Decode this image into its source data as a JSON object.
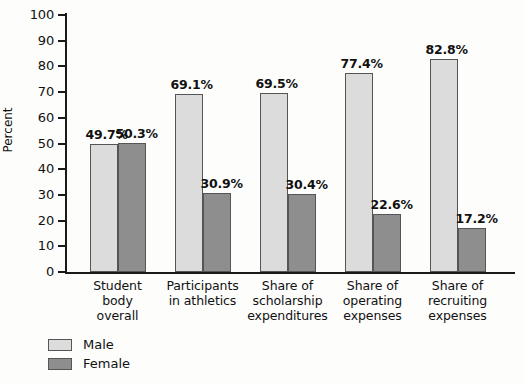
{
  "chart_data": {
    "type": "bar",
    "title": "",
    "xlabel": "",
    "ylabel": "Percent",
    "ylim": [
      0,
      100
    ],
    "ytick_step": 10,
    "yticks": [
      100,
      90,
      80,
      70,
      60,
      50,
      40,
      30,
      20,
      10,
      0
    ],
    "grid": false,
    "legend_position": "bottom-left",
    "value_suffix": "%",
    "categories": [
      "Student body overall",
      "Participants in athletics",
      "Share of scholarship expenditures",
      "Share of operating expenses",
      "Share of recruiting expenses"
    ],
    "category_lines": [
      [
        "Student",
        "body",
        "overall"
      ],
      [
        "Participants",
        "in athletics"
      ],
      [
        "Share of",
        "scholarship",
        "expenditures"
      ],
      [
        "Share of",
        "operating",
        "expenses"
      ],
      [
        "Share of",
        "recruiting",
        "expenses"
      ]
    ],
    "series": [
      {
        "name": "Male",
        "color": "#dcdcdc",
        "values": [
          49.7,
          69.1,
          69.5,
          77.4,
          82.8
        ],
        "labels": [
          "49.7%",
          "69.1%",
          "69.5%",
          "77.4%",
          "82.8%"
        ]
      },
      {
        "name": "Female",
        "color": "#8e8e8e",
        "values": [
          50.3,
          30.9,
          30.4,
          22.6,
          17.2
        ],
        "labels": [
          "50.3%",
          "30.9%",
          "30.4%",
          "22.6%",
          "17.2%"
        ]
      }
    ]
  },
  "axis": {
    "y_title": "Percent",
    "tick_labels": [
      "100",
      "90",
      "80",
      "70",
      "60",
      "50",
      "40",
      "30",
      "20",
      "10",
      "0"
    ]
  },
  "legend": {
    "items": [
      {
        "label": "Male"
      },
      {
        "label": "Female"
      }
    ]
  }
}
